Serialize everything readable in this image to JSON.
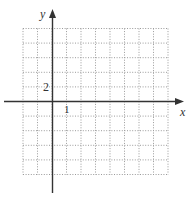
{
  "chart_data": {
    "type": "coordinate-grid",
    "title": "",
    "xlabel": "x",
    "ylabel": "y",
    "x_tick_label": "1",
    "y_tick_label": "2",
    "x_scale_per_cell": 1,
    "y_scale_per_cell": 2,
    "grid": true,
    "grid_style": "dotted",
    "grid_cells": {
      "columns": 10,
      "rows": 10
    },
    "origin_cell_offset": {
      "from_left": 2,
      "from_top": 5
    },
    "xlim": [
      -2,
      8
    ],
    "ylim": [
      -10,
      10
    ],
    "series": []
  },
  "axes": {
    "x_label": "x",
    "y_label": "y",
    "x_tick": "1",
    "y_tick": "2"
  },
  "colors": {
    "axis": "#333333",
    "grid": "#9a9a9a",
    "text": "#333333"
  }
}
